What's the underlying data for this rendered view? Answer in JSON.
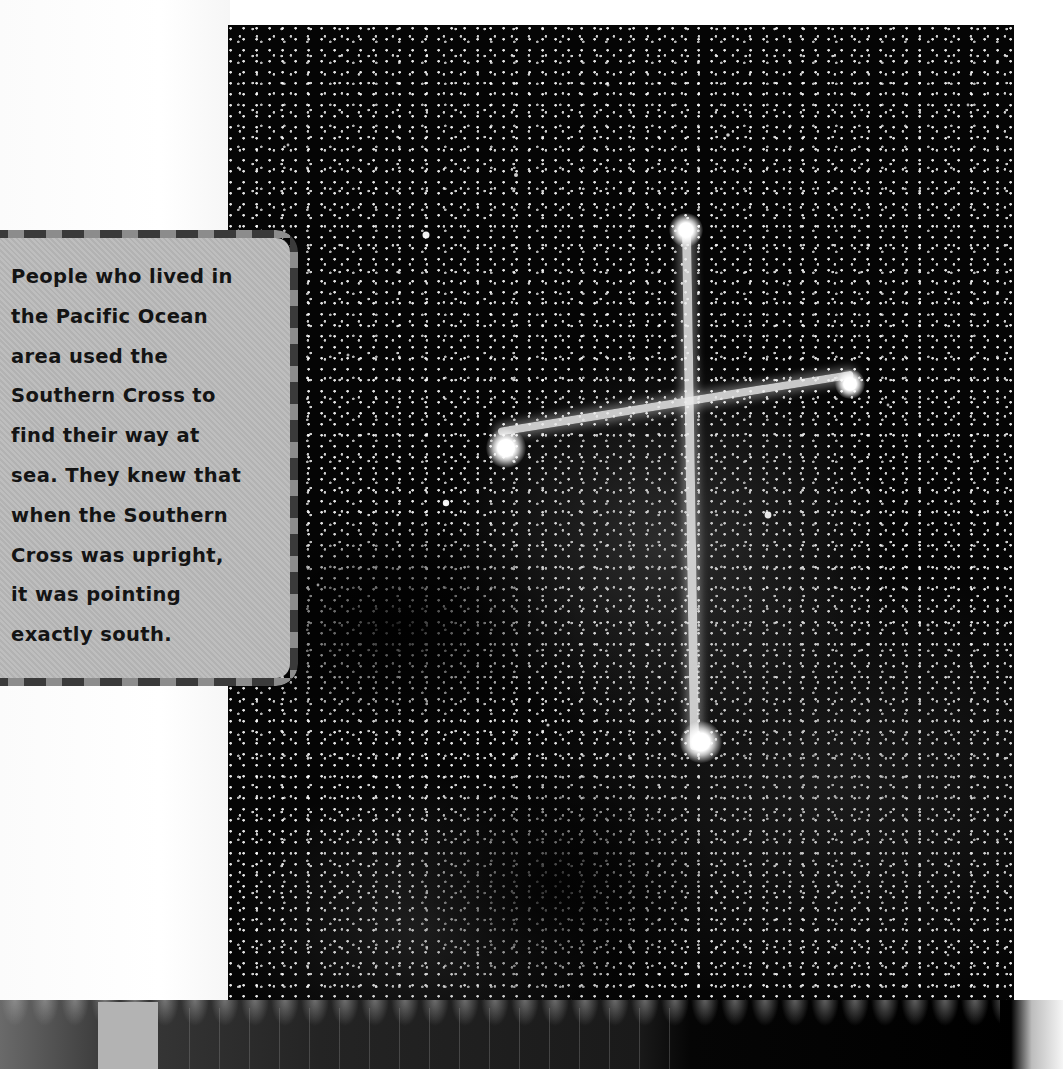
{
  "page": {
    "background_color": "#ffffff"
  },
  "photo": {
    "subject": "Southern Cross constellation star field",
    "background_color": "#050505",
    "cross_color": "#ebebeb"
  },
  "callout": {
    "text": "People who lived in the Pacific Ocean area used the Southern Cross to find their way at sea. They knew that when the Southern Cross was upright, it was pointing exactly south.",
    "lines": [
      "People who lived in",
      "the Pacific Ocean",
      "area used the",
      "Southern Cross to",
      "find their way at",
      "sea. They knew that",
      "when the Southern",
      "Cross was upright,",
      "it was pointing",
      "exactly south."
    ],
    "background_color": "#b9b9b9",
    "border_dark": "#3a3a3a",
    "border_light": "#8c8c8c",
    "text_color": "#141414"
  }
}
